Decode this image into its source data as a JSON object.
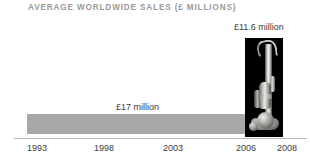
{
  "chart": {
    "title": "AVERAGE WORLDWIDE SALES (£ MILLIONS)"
  },
  "labels": {
    "bar_value": "£17 million",
    "product_value": "£11.6 million"
  },
  "axis": {
    "ticks": [
      {
        "label": "1993",
        "x": 27
      },
      {
        "label": "1998",
        "x": 94
      },
      {
        "label": "2003",
        "x": 163
      },
      {
        "label": "2006",
        "x": 236
      },
      {
        "label": "2008",
        "x": 277
      }
    ]
  },
  "colors": {
    "bar": "#a8a8a8",
    "panel": "#000000",
    "title": "#9a9a9a",
    "text": "#3b3b3b",
    "axis": "#b9b9b9"
  },
  "icons": {
    "product": "upright-vacuum-cleaner"
  },
  "chart_data": {
    "type": "bar",
    "title": "AVERAGE WORLDWIDE SALES (£ MILLIONS)",
    "xlabel": "",
    "ylabel": "",
    "orientation": "horizontal",
    "categories": [
      "1993-2006",
      "2006-2008"
    ],
    "values": [
      17,
      11.6
    ],
    "data_labels": [
      "£17 million",
      "£11.6 million"
    ],
    "units": "£ millions",
    "x": [
      1993,
      1998,
      2003,
      2006,
      2008
    ],
    "tick_labels": [
      "1993",
      "1998",
      "2003",
      "2006",
      "2008"
    ],
    "xlim": [
      1993,
      2008
    ],
    "grid": false,
    "legend": "none",
    "annotations": [
      "Gray band spans 1993 to 2006 labelled £17 million",
      "Black panel with upright vacuum cleaner photograph spans 2006 to 2008 labelled £11.6 million"
    ]
  }
}
